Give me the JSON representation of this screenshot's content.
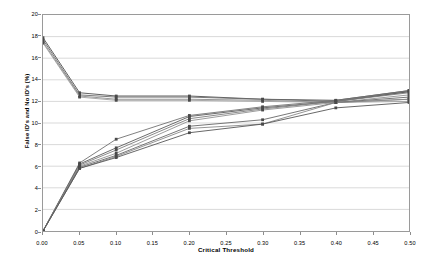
{
  "chart_data": {
    "type": "line",
    "title": "",
    "xlabel": "Critical Threshold",
    "ylabel": "False ID's and No ID's (%)",
    "xlim": [
      0.0,
      0.5
    ],
    "ylim": [
      0,
      20
    ],
    "x": [
      0.0,
      0.05,
      0.1,
      0.2,
      0.3,
      0.4,
      0.5
    ],
    "x_tick_labels": [
      "0.00",
      "0.05",
      "0.10",
      "0.15",
      "0.20",
      "0.25",
      "0.30",
      "0.35",
      "0.40",
      "0.45",
      "0.50"
    ],
    "x_tick_values": [
      0.0,
      0.05,
      0.1,
      0.15,
      0.2,
      0.25,
      0.3,
      0.35,
      0.4,
      0.45,
      0.5
    ],
    "y_tick_labels": [
      "0",
      "2",
      "4",
      "6",
      "8",
      "10",
      "12",
      "14",
      "16",
      "18",
      "20"
    ],
    "y_tick_values": [
      0,
      2,
      4,
      6,
      8,
      10,
      12,
      14,
      16,
      18,
      20
    ],
    "grid": "horizontal",
    "legend_position": "none",
    "marker": "square",
    "series": [
      {
        "name": "False ID's 1",
        "group": "false-ids",
        "color": "#4d4d4d",
        "values": [
          17.9,
          12.8,
          12.5,
          12.5,
          12.2,
          12.1,
          13.0
        ]
      },
      {
        "name": "False ID's 2",
        "group": "false-ids",
        "color": "#6b6b6b",
        "values": [
          17.7,
          12.6,
          12.4,
          12.4,
          12.2,
          12.0,
          12.9
        ]
      },
      {
        "name": "False ID's 3",
        "group": "false-ids",
        "color": "#8a8a8a",
        "values": [
          17.5,
          12.5,
          12.2,
          12.2,
          12.1,
          11.9,
          12.2
        ]
      },
      {
        "name": "False ID's 4",
        "group": "false-ids",
        "color": "#a0a0a0",
        "values": [
          17.4,
          12.4,
          12.1,
          12.1,
          12.0,
          11.9,
          12.0
        ]
      },
      {
        "name": "No ID's 1",
        "group": "no-ids",
        "color": "#707070",
        "values": [
          0.0,
          6.3,
          8.5,
          10.7,
          11.5,
          12.1,
          13.0
        ]
      },
      {
        "name": "No ID's 2",
        "group": "no-ids",
        "color": "#5a5a5a",
        "values": [
          0.0,
          6.2,
          7.7,
          10.6,
          11.4,
          12.0,
          12.9
        ]
      },
      {
        "name": "No ID's 3",
        "group": "no-ids",
        "color": "#7d7d7d",
        "values": [
          0.0,
          6.1,
          7.5,
          10.4,
          11.3,
          12.0,
          12.8
        ]
      },
      {
        "name": "No ID's 4",
        "group": "no-ids",
        "color": "#909090",
        "values": [
          0.0,
          6.0,
          7.2,
          10.2,
          11.2,
          11.9,
          12.6
        ]
      },
      {
        "name": "No ID's 5",
        "group": "no-ids",
        "color": "#666666",
        "values": [
          0.0,
          5.9,
          7.0,
          9.7,
          10.3,
          11.9,
          12.4
        ]
      },
      {
        "name": "No ID's 6",
        "group": "no-ids",
        "color": "#888888",
        "values": [
          0.0,
          5.8,
          6.9,
          9.5,
          9.9,
          11.9,
          12.2
        ]
      },
      {
        "name": "No ID's 7",
        "group": "no-ids",
        "color": "#555555",
        "values": [
          0.0,
          5.8,
          6.8,
          9.1,
          9.9,
          11.4,
          11.9
        ]
      }
    ]
  },
  "style": {
    "frame_color": "#9a9a9a",
    "grid_color": "#c8c8c8",
    "background": "#ffffff",
    "marker_color": "#4a4a4a"
  }
}
